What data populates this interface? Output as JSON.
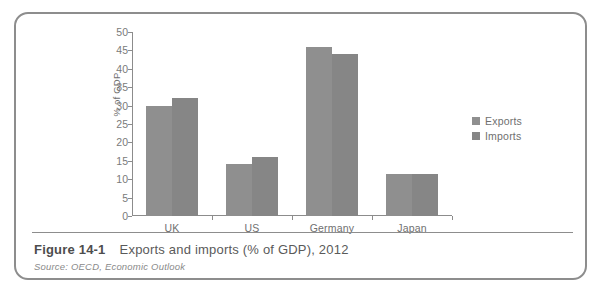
{
  "figure": {
    "number": "Figure 14-1",
    "title": "Exports and imports (% of GDP), 2012",
    "source": "Source: OECD, Economic Outlook"
  },
  "legend": {
    "items": [
      {
        "label": "Exports",
        "color": "#8f8f8f"
      },
      {
        "label": "Imports",
        "color": "#868686"
      }
    ]
  },
  "axis": {
    "y_title": "% of GDP",
    "y_ticks": [
      "0",
      "5",
      "10",
      "15",
      "20",
      "25",
      "30",
      "35",
      "40",
      "45",
      "50"
    ]
  },
  "chart_data": {
    "type": "bar",
    "title": "Exports and imports (% of GDP), 2012",
    "xlabel": "",
    "ylabel": "% of GDP",
    "ylim": [
      0,
      50
    ],
    "ytick_step": 5,
    "grid": false,
    "legend_position": "right",
    "categories": [
      "UK",
      "US",
      "Germany",
      "Japan"
    ],
    "series": [
      {
        "name": "Exports",
        "color": "#8f8f8f",
        "values": [
          30,
          14,
          46,
          11.5
        ]
      },
      {
        "name": "Imports",
        "color": "#868686",
        "values": [
          32,
          16,
          44,
          11.5
        ]
      }
    ]
  }
}
